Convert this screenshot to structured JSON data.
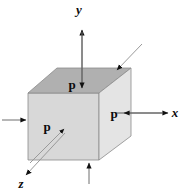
{
  "figure": {
    "title": "",
    "background_color": "#ffffff",
    "stroke_color": "#4d4d4d",
    "label_color": "#0b0b0b"
  },
  "axes": [
    {
      "name": "y-axis",
      "label": "y",
      "direction": "up",
      "label_x": 79,
      "label_y": 14
    },
    {
      "name": "x-axis",
      "label": "x",
      "direction": "right",
      "label_x": 175,
      "label_y": 117
    },
    {
      "name": "z-axis",
      "label": "z",
      "direction": "down-left",
      "label_x": 21,
      "label_y": 188
    }
  ],
  "cube": {
    "name": "pressure-cube",
    "top_face_color": "#b3b3b3",
    "front_face_color": "#d6d6d6",
    "right_face_color": "#e3e3e3",
    "edge_color": "#7a7a7a"
  },
  "pressure_labels": [
    {
      "name": "p-top",
      "text": "p",
      "x": 72,
      "y": 89
    },
    {
      "name": "p-front",
      "text": "p",
      "x": 47,
      "y": 131
    },
    {
      "name": "p-right",
      "text": "p",
      "x": 114,
      "y": 118
    }
  ],
  "pressure_arrows": [
    {
      "name": "arrow-top-down",
      "from": "above",
      "to": "top-face"
    },
    {
      "name": "arrow-top-back-diag",
      "from": "upper-right",
      "to": "back-top-edge"
    },
    {
      "name": "arrow-right-inward",
      "from": "right",
      "to": "right-face"
    },
    {
      "name": "arrow-left-inward",
      "from": "left",
      "to": "left-face"
    },
    {
      "name": "arrow-bottom-up",
      "from": "below",
      "to": "bottom-face"
    },
    {
      "name": "arrow-front-diag",
      "from": "lower-left",
      "to": "front-face"
    }
  ]
}
